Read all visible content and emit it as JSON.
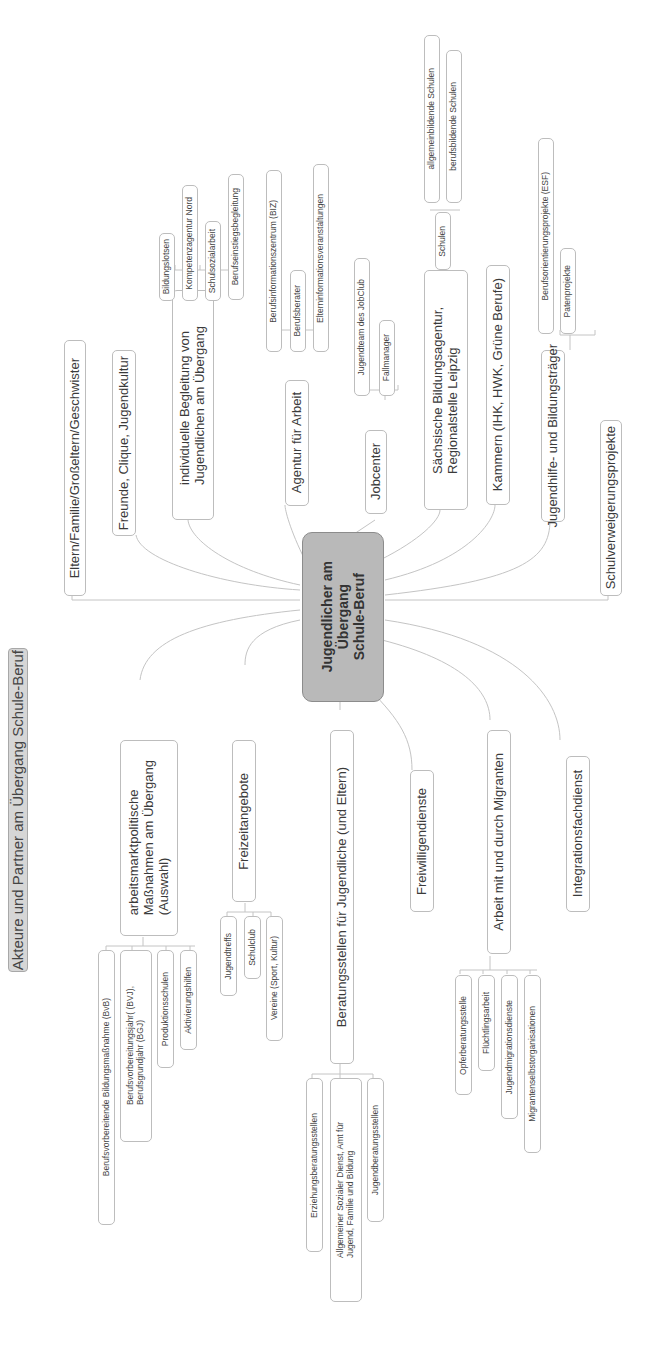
{
  "title": "Akteure und Partner am Übergang Schule-Beruf",
  "center": "Jugendlicher am\nÜbergang\nSchule-Beruf",
  "colors": {
    "center_fill": "#b9b9b9",
    "title_fill": "#d6d6d6",
    "border": "#bdbdbd",
    "line": "#c4c4c4"
  },
  "branches_right": [
    {
      "label": "Eltern/Familie/Großeltern/Geschwister",
      "children": []
    },
    {
      "label": "Freunde, Clique, Jugendkultur",
      "children": []
    },
    {
      "label": "individuelle Begleitung von\nJugendlichen am Übergang",
      "children": [
        "Bildungslotsen",
        "Kompetenzagentur Nord",
        "Schulsozialarbeit",
        "Berufseinstiegsbegleitung"
      ]
    },
    {
      "label": "Agentur für Arbeit",
      "children": [
        "Berufsinformationszentrum (BIZ)",
        "Berufsberater",
        "Elterninformationsveranstaltungen"
      ]
    },
    {
      "label": "Jobcenter",
      "children": [
        "Jugendteam des JobClub",
        "Fallmanager"
      ]
    },
    {
      "label": "Sächsische Bildungsagentur,\nRegionalstelle Leipzig",
      "children": [
        {
          "label": "Schulen",
          "children": [
            "allgemeinbildende Schulen",
            "berufsbildende Schulen"
          ]
        }
      ]
    },
    {
      "label": "Kammern (IHK, HWK, Grüne Berufe)",
      "children": []
    },
    {
      "label": "Jugendhilfe- und Bildungsträger",
      "children": [
        "Berufsorientierungsprojekte (ESF)",
        "Patenprojekte"
      ]
    },
    {
      "label": "Schulverweigerungsprojekte",
      "children": []
    }
  ],
  "branches_left": [
    {
      "label": "arbeitsmarktpolitische\nMaßnahmen am Übergang\n(Auswahl)",
      "children": [
        "Berufsvorbereitende Bildungsmaßnahme (BvB)",
        "Berufsvorbereitungsjahr( (BVJ),\nBerufsgrundjahr (BGJ)",
        "Produktionsschulen",
        "Aktivierungshilfen"
      ]
    },
    {
      "label": "Freizeitangebote",
      "children": [
        "Jugendtreffs",
        "Schulclub",
        "Vereine (Sport, Kultur)"
      ]
    },
    {
      "label": "Beratungsstellen für Jugendliche (und Eltern)",
      "children": [
        "Erziehungsberatungsstellen",
        "Allgemeiner Sozialer Dienst, Amt für\nJugend, Familie und Bildung",
        "Jugendberatungsstellen"
      ]
    },
    {
      "label": "Freiwilligendienste",
      "children": []
    },
    {
      "label": "Arbeit mit und durch Migranten",
      "children": [
        "Opferberatungsstelle",
        "Flüchtlingsarbeit",
        "Jugendmigrationsdienste",
        "Migrantenselbstorganisationen"
      ]
    },
    {
      "label": "Integrationsfachdienst",
      "children": []
    }
  ]
}
